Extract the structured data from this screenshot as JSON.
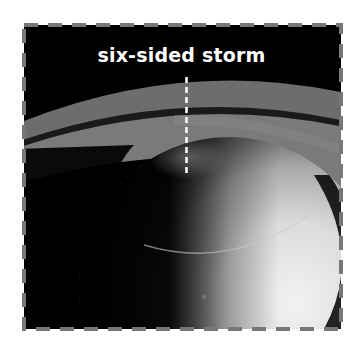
{
  "figure": {
    "annotation_label": "six-sided storm",
    "border_style": "dashed",
    "colors": {
      "border": "#777777",
      "annotation": "#ffffff",
      "background": "#000000"
    }
  }
}
